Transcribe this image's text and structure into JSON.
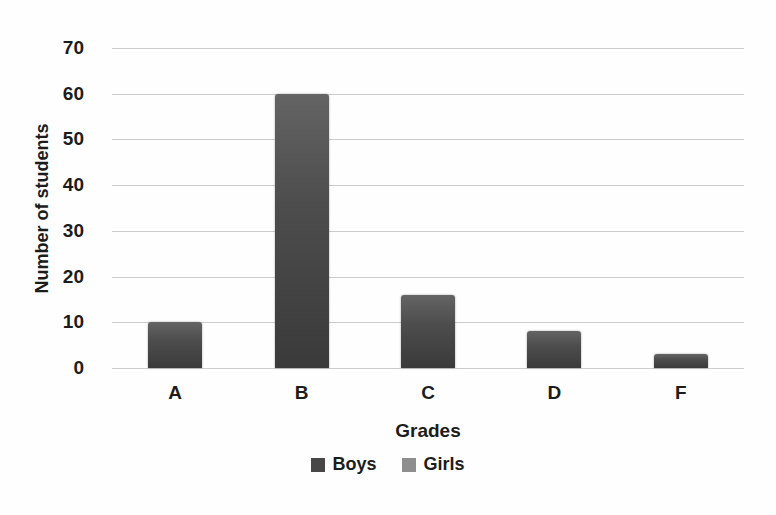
{
  "chart_data": {
    "type": "bar",
    "title": "",
    "categories": [
      "A",
      "B",
      "C",
      "D",
      "F"
    ],
    "values": [
      10,
      60,
      16,
      8,
      3
    ],
    "series": [
      {
        "name": "Boys",
        "values": [
          10,
          60,
          16,
          8,
          3
        ]
      }
    ],
    "xlabel": "Grades",
    "ylabel": "Number of students",
    "ylim": [
      0,
      70
    ],
    "ytick_step": 10,
    "grid": "horizontal-only",
    "gridline_color": "#cccccc",
    "bar_color_top": "#646464",
    "bar_color_bottom": "#3a3a3a",
    "legend": {
      "position": "bottom-center",
      "entries": [
        {
          "label": "Boys",
          "color": "#474747"
        },
        {
          "label": "Girls",
          "color": "#8e8e8e"
        }
      ]
    }
  }
}
